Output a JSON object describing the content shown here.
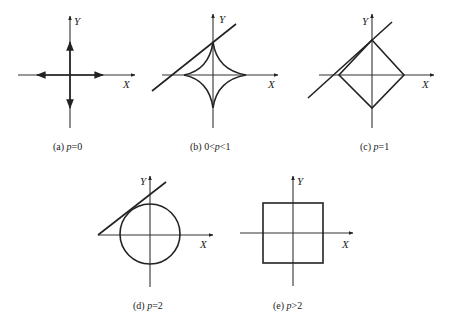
{
  "figure": {
    "panels": [
      {
        "id": "a",
        "caption_prefix": "(a) ",
        "caption_var": "p",
        "caption_rel": "=0",
        "x_label": "X",
        "y_label": "Y",
        "shape": "cross-arrows"
      },
      {
        "id": "b",
        "caption_prefix": "(b) 0<",
        "caption_var": "p",
        "caption_rel": "<1",
        "x_label": "X",
        "y_label": "Y",
        "shape": "astroid"
      },
      {
        "id": "c",
        "caption_prefix": "(c) ",
        "caption_var": "p",
        "caption_rel": "=1",
        "x_label": "X",
        "y_label": "Y",
        "shape": "diamond"
      },
      {
        "id": "d",
        "caption_prefix": "(d) ",
        "caption_var": "p",
        "caption_rel": "=2",
        "x_label": "X",
        "y_label": "Y",
        "shape": "circle"
      },
      {
        "id": "e",
        "caption_prefix": "(e) ",
        "caption_var": "p",
        "caption_rel": ">2",
        "x_label": "X",
        "y_label": "Y",
        "shape": "square"
      }
    ]
  }
}
